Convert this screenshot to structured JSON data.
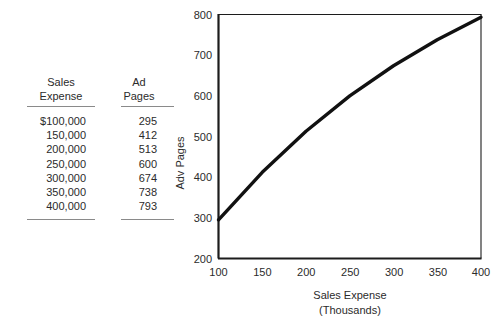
{
  "table": {
    "headers": [
      {
        "line1": "Sales",
        "line2": "Expense"
      },
      {
        "line1": "Ad",
        "line2": "Pages"
      }
    ],
    "rows": [
      {
        "sales_expense": "$100,000",
        "ad_pages": "295"
      },
      {
        "sales_expense": "150,000",
        "ad_pages": "412"
      },
      {
        "sales_expense": "200,000",
        "ad_pages": "513"
      },
      {
        "sales_expense": "250,000",
        "ad_pages": "600"
      },
      {
        "sales_expense": "300,000",
        "ad_pages": "674"
      },
      {
        "sales_expense": "350,000",
        "ad_pages": "738"
      },
      {
        "sales_expense": "400,000",
        "ad_pages": "793"
      }
    ]
  },
  "chart_data": {
    "type": "line",
    "title": "",
    "xlabel": "Sales Expense",
    "xlabel_sub": "(Thousands)",
    "ylabel": "Adv Pages",
    "x": [
      100,
      150,
      200,
      250,
      300,
      350,
      400
    ],
    "values": [
      295,
      412,
      513,
      600,
      674,
      738,
      793
    ],
    "series": [
      {
        "name": "Adv Pages",
        "values": [
          295,
          412,
          513,
          600,
          674,
          738,
          793
        ]
      }
    ],
    "xlim": [
      100,
      400
    ],
    "ylim": [
      200,
      800
    ],
    "xticks": [
      100,
      150,
      200,
      250,
      300,
      350,
      400
    ],
    "yticks": [
      200,
      300,
      400,
      500,
      600,
      700,
      800
    ],
    "xtick_labels": [
      "100",
      "150",
      "200",
      "250",
      "300",
      "350",
      "400"
    ],
    "ytick_labels": [
      "200",
      "300",
      "400",
      "500",
      "600",
      "700",
      "800"
    ],
    "grid": false,
    "legend": false,
    "line_color": "#111111"
  }
}
